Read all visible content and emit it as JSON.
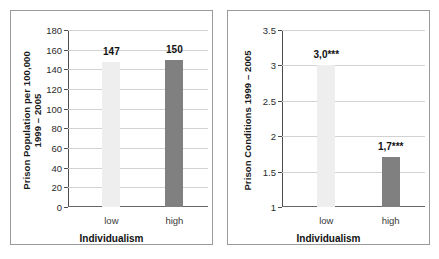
{
  "figure": {
    "background": "#ffffff",
    "panel_border_color": "#9a9a9a",
    "bar_light_color": "#eeeeee",
    "bar_dark_color": "#808080",
    "gridline_color": "#d2d2d2"
  },
  "chart_data": [
    {
      "type": "bar",
      "panel": "left",
      "title": "",
      "xlabel": "Individualism",
      "ylabel": "Prison Population per 100,000\n1999 – 2005",
      "ylabel_line1": "Prison Population per 100,000",
      "ylabel_line2": "1999 – 2005",
      "categories": [
        "low",
        "high"
      ],
      "values": [
        147,
        150
      ],
      "value_labels": [
        "147",
        "150"
      ],
      "bar_colors": [
        "#eeeeee",
        "#808080"
      ],
      "ylim": [
        0,
        180
      ],
      "yticks": [
        0,
        20,
        40,
        60,
        80,
        100,
        120,
        140,
        160,
        180
      ],
      "ytick_labels": [
        "0",
        "20",
        "40",
        "60",
        "80",
        "100",
        "120",
        "140",
        "160",
        "180"
      ],
      "grid": true,
      "legend": "none"
    },
    {
      "type": "bar",
      "panel": "right",
      "title": "",
      "xlabel": "Individualism",
      "ylabel": "Prison Conditions 1999 – 2005",
      "ylabel_line1": "Prison Conditions 1999 – 2005",
      "ylabel_line2": "",
      "categories": [
        "low",
        "high"
      ],
      "values": [
        3.0,
        1.7
      ],
      "value_labels": [
        "3,0***",
        "1,7***"
      ],
      "bar_colors": [
        "#eeeeee",
        "#808080"
      ],
      "ylim": [
        1,
        3.5
      ],
      "yticks": [
        1,
        1.5,
        2,
        2.5,
        3,
        3.5
      ],
      "ytick_labels": [
        "1",
        "1.5",
        "2",
        "2.5",
        "3",
        "3.5"
      ],
      "grid": true,
      "legend": "none"
    }
  ]
}
